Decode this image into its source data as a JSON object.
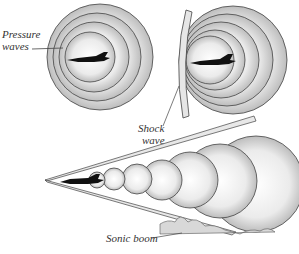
{
  "diagram": {
    "panels": [
      {
        "id": "subsonic",
        "label": "Pressure waves",
        "label_lines": [
          "Pressure",
          "waves"
        ]
      },
      {
        "id": "sonic",
        "label": "Shock wave",
        "label_lines": [
          "Shock",
          "wave"
        ]
      },
      {
        "id": "supersonic",
        "label": "Sonic boom"
      }
    ],
    "labels": {
      "pressure_1": "Pressure",
      "pressure_2": "waves",
      "shock_1": "Shock",
      "shock_2": "wave",
      "boom": "Sonic boom"
    },
    "colors": {
      "stroke": "#333333",
      "fill_light": "#f2f2f2",
      "fill_dark": "#c8c8c8",
      "plane": "#111111"
    }
  }
}
